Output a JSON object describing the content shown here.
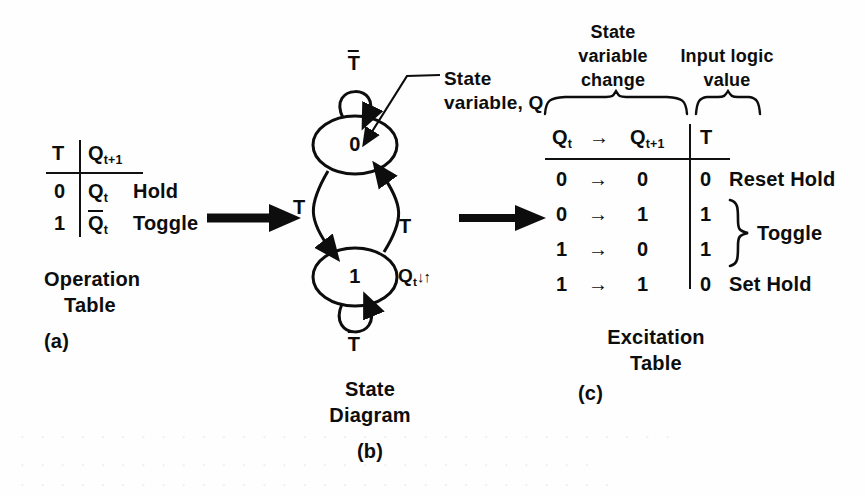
{
  "figure": {
    "background_color": "#fefefe",
    "ink_color": "#0d0d0d"
  },
  "operation_table": {
    "caption_line1": "Operation",
    "caption_line2": "Table",
    "part_label": "(a)",
    "headers": {
      "input": "T",
      "next_state_base": "Q",
      "next_state_sub": "t+1"
    },
    "rows": [
      {
        "t": "0",
        "q_base": "Q",
        "q_sub": "t",
        "q_bar": false,
        "operation": "Hold"
      },
      {
        "t": "1",
        "q_base": "Q",
        "q_sub": "t",
        "q_bar": true,
        "operation": "Toggle"
      }
    ]
  },
  "state_diagram": {
    "caption_line1": "State",
    "caption_line2": "Diagram",
    "part_label": "(b)",
    "states": [
      {
        "id": "state-0",
        "label": "0"
      },
      {
        "id": "state-1",
        "label": "1"
      }
    ],
    "self_loop_top_label": "T",
    "self_loop_top_bar": true,
    "self_loop_bottom_label": "T",
    "self_loop_bottom_bar": true,
    "transition_left_label": "T",
    "transition_right_label": "T",
    "annotation_line1": "State",
    "annotation_line2": "variable, Q",
    "state_change_note_base": "Q",
    "state_change_note_sub": "t",
    "state_change_note_arrows": "↓↑"
  },
  "excitation_table": {
    "caption_line1": "Excitation",
    "caption_line2": "Table",
    "part_label": "(c)",
    "group_headers": [
      {
        "name": "state-variable-change",
        "lines": [
          "State",
          "variable",
          "change"
        ]
      },
      {
        "name": "input-logic-value",
        "lines": [
          "Input logic",
          "value"
        ]
      }
    ],
    "column_headers": {
      "current_base": "Q",
      "current_sub": "t",
      "arrow": "→",
      "next_base": "Q",
      "next_sub": "t+1",
      "input": "T"
    },
    "rows": [
      {
        "qt": "0",
        "arrow": "→",
        "qt1": "0",
        "t": "0",
        "note": "Reset Hold"
      },
      {
        "qt": "0",
        "arrow": "→",
        "qt1": "1",
        "t": "1",
        "note": ""
      },
      {
        "qt": "1",
        "arrow": "→",
        "qt1": "0",
        "t": "1",
        "note": ""
      },
      {
        "qt": "1",
        "arrow": "→",
        "qt1": "1",
        "t": "0",
        "note": "Set Hold"
      }
    ],
    "brace_note": "Toggle"
  },
  "flow_arrows": [
    {
      "name": "arrow-table-to-diagram"
    },
    {
      "name": "arrow-diagram-to-excitation"
    }
  ],
  "scan_artifacts": {
    "line1": "· · ·   · · · ·  ·  · · ·    · ·  · · · ·   · ·  · · ·  · · ·   · · · ·  ·  · · ·",
    "line2": "· ·  · · ·   · ·  · · · ·  · · ·   · · ·  · ·  · · · ·   ·  · · ·  · ·",
    "line3": "· · ·  · ·   · · · ·  · ·  · · ·   · · · ·  · · ·  · ·  · · · ·  · · ·"
  }
}
